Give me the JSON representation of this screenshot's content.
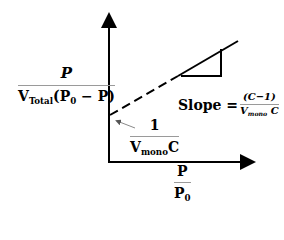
{
  "diagram": {
    "type": "BET linear plot schematic",
    "y_axis_label": {
      "numerator": "P",
      "denominator_prefix": "V",
      "denominator_sub": "Total",
      "denominator_rest": "(P",
      "denominator_rest_sub": "0",
      "denominator_tail": " − P)"
    },
    "x_axis_label": {
      "numerator": "P",
      "denominator": "P",
      "denominator_sub": "0"
    },
    "intercept_label": {
      "numerator": "1",
      "denominator_prefix": "V",
      "denominator_sub": "mono",
      "denominator_tail": "C"
    },
    "slope_label": {
      "prefix": "Slope =",
      "numerator": "(C−1)",
      "denominator_prefix": "V",
      "denominator_sub": "mono",
      "denominator_tail": " C"
    },
    "colors": {
      "line": "#000000",
      "arrow_pointer": "#8a8a8a",
      "fraction_bar": "#9a9a9a",
      "background": "#ffffff"
    }
  }
}
